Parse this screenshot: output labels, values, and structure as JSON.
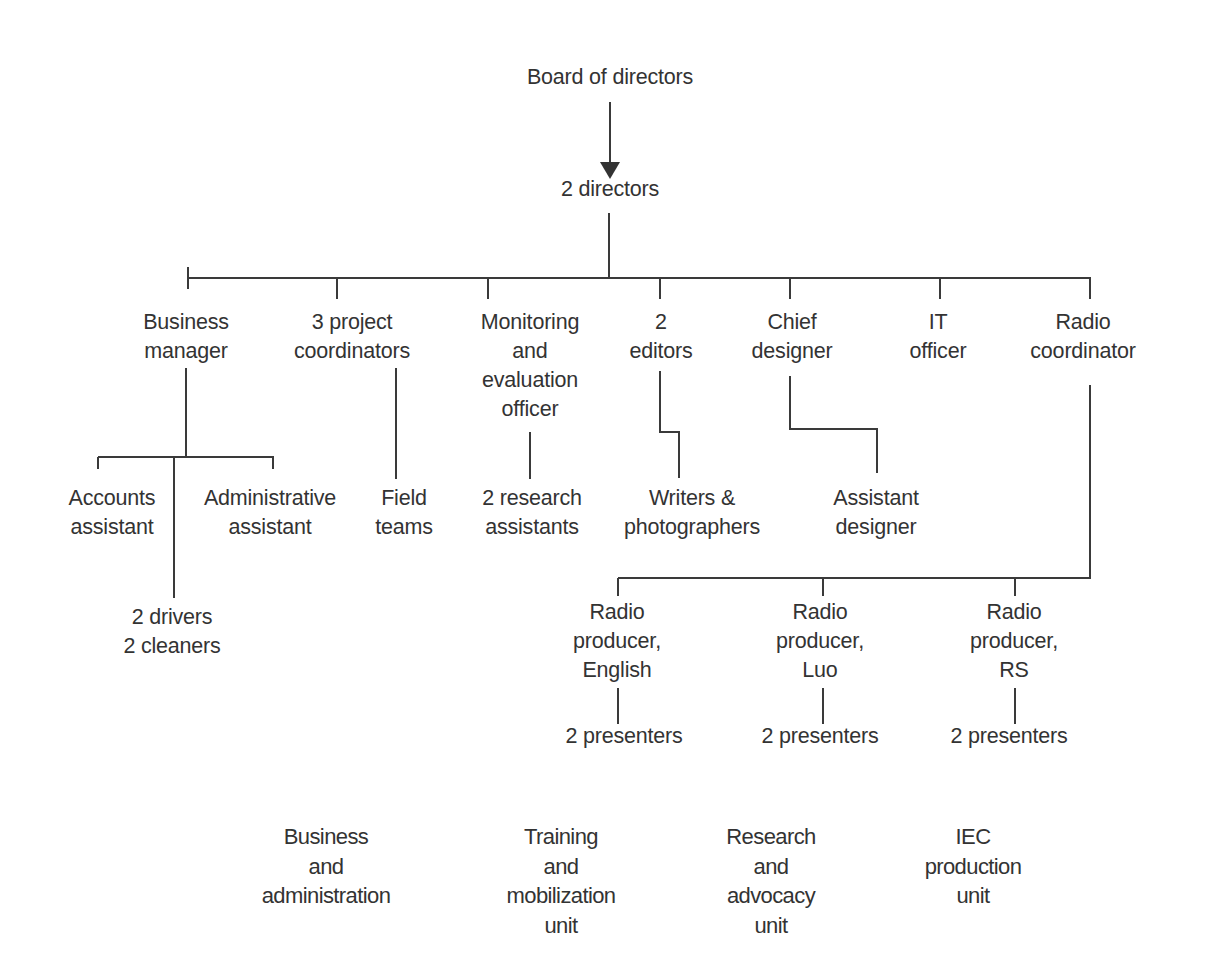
{
  "chart": {
    "top": {
      "board": "Board of directors",
      "directors": "2 directors"
    },
    "managers": [
      {
        "lines": [
          "Business",
          "manager"
        ]
      },
      {
        "lines": [
          "3 project",
          "coordinators"
        ]
      },
      {
        "lines": [
          "Monitoring",
          "and",
          "evaluation",
          "officer"
        ]
      },
      {
        "lines": [
          "2",
          "editors"
        ]
      },
      {
        "lines": [
          "Chief",
          "designer"
        ]
      },
      {
        "lines": [
          "IT",
          "officer"
        ]
      },
      {
        "lines": [
          "Radio",
          "coordinator"
        ]
      }
    ],
    "staff": {
      "accounts_assistant": [
        "Accounts",
        "assistant"
      ],
      "administrative_assistant": [
        "Administrative",
        "assistant"
      ],
      "drivers_cleaners": [
        "2 drivers",
        "2 cleaners"
      ],
      "field_teams": [
        "Field",
        "teams"
      ],
      "research_assistants": [
        "2 research",
        "assistants"
      ],
      "writers_photographers": [
        "Writers &",
        "photographers"
      ],
      "assistant_designer": [
        "Assistant",
        "designer"
      ]
    },
    "radio_producers": [
      {
        "lines": [
          "Radio",
          "producer,",
          "English"
        ],
        "presenters": "2 presenters"
      },
      {
        "lines": [
          "Radio",
          "producer,",
          "Luo"
        ],
        "presenters": "2 presenters"
      },
      {
        "lines": [
          "Radio",
          "producer,",
          "RS"
        ],
        "presenters": "2 presenters"
      }
    ],
    "units": [
      {
        "lines": [
          "Business",
          "and",
          "administration"
        ]
      },
      {
        "lines": [
          "Training",
          "and",
          "mobilization",
          "unit"
        ]
      },
      {
        "lines": [
          "Research",
          "and",
          "advocacy",
          "unit"
        ]
      },
      {
        "lines": [
          "IEC",
          "production",
          "unit"
        ]
      }
    ]
  },
  "colors": {
    "text": "#333333",
    "lines": "#3a3a3a",
    "background": "#ffffff"
  }
}
